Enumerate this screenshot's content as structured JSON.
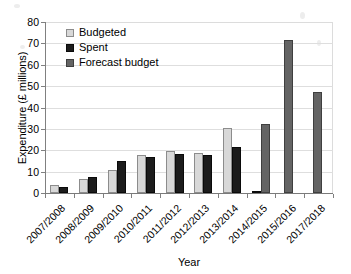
{
  "chart_data": {
    "type": "bar",
    "title": "",
    "xlabel": "Year",
    "ylabel": "Expenditure (£ millions)",
    "ylim": [
      0,
      80
    ],
    "ytick_step": 10,
    "yticks": [
      0,
      10,
      20,
      30,
      40,
      50,
      60,
      70,
      80
    ],
    "ytick_labels": [
      "0",
      "10",
      "20",
      "30",
      "40",
      "50",
      "60",
      "70",
      "80"
    ],
    "grid": true,
    "grid_axis": "y",
    "legend_position": "upper left",
    "categories": [
      "2007/2008",
      "2008/2009",
      "2009/2010",
      "2010/2011",
      "2011/2012",
      "2012/2013",
      "2013/2014",
      "2014/2015",
      "2015/2016",
      "2017/2018"
    ],
    "series": [
      {
        "name": "Budgeted",
        "color": "#d8d8d8",
        "values": [
          3.9,
          6.6,
          10.8,
          18.0,
          19.8,
          18.7,
          30.2,
          null,
          null,
          null
        ]
      },
      {
        "name": "Spent",
        "color": "#1c1c1c",
        "values": [
          2.8,
          7.5,
          15.0,
          16.9,
          18.2,
          17.8,
          21.6,
          1.1,
          null,
          null
        ]
      },
      {
        "name": "Forecast budget",
        "color": "#646464",
        "values": [
          null,
          null,
          null,
          null,
          null,
          null,
          null,
          32.4,
          71.5,
          47.4
        ]
      }
    ]
  },
  "legend": {
    "items": [
      {
        "label": "Budgeted"
      },
      {
        "label": "Spent"
      },
      {
        "label": "Forecast budget"
      }
    ]
  },
  "axes": {
    "y_title": "Expenditure (£ millions)",
    "x_title": "Year"
  }
}
